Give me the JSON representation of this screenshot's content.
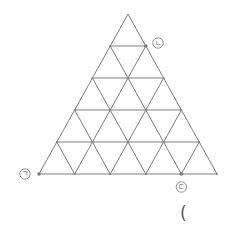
{
  "diagram": {
    "type": "triangular-grid",
    "rows": 5,
    "apex": [
      128,
      14
    ],
    "base_left": [
      39,
      174
    ],
    "base_right": [
      217,
      174
    ],
    "line_color": "#6e6e6e",
    "labels": {
      "giyeok": {
        "text": "ㄱ",
        "point": [
          39,
          174
        ],
        "label_pos": [
          25,
          174
        ]
      },
      "nieun": {
        "text": "ㄴ",
        "point": [
          145.8,
          46
        ],
        "label_pos": [
          158,
          43
        ]
      },
      "digeut": {
        "text": "ㄷ",
        "point": [
          181.4,
          174
        ],
        "label_pos": [
          181.4,
          187
        ]
      }
    }
  },
  "answer_bracket": "("
}
